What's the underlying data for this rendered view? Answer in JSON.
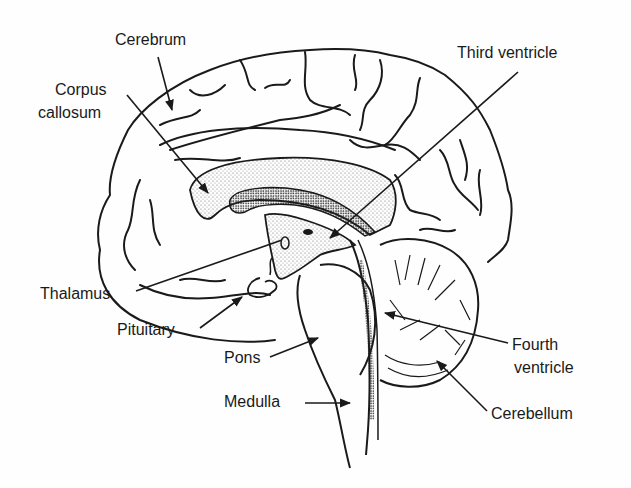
{
  "diagram": {
    "type": "anatomical-illustration",
    "labels": {
      "cerebrum": "Cerebrum",
      "corpus_callosum_line1": "Corpus",
      "corpus_callosum_line2": "callosum",
      "third_ventricle": "Third ventricle",
      "thalamus": "Thalamus",
      "pituitary": "Pituitary",
      "pons": "Pons",
      "medulla": "Medulla",
      "fourth_ventricle_line1": "Fourth",
      "fourth_ventricle_line2": "ventricle",
      "cerebellum": "Cerebellum"
    }
  },
  "colors": {
    "ink": "#1a1a1a",
    "background": "#fefefe",
    "stipple": "#555555"
  }
}
